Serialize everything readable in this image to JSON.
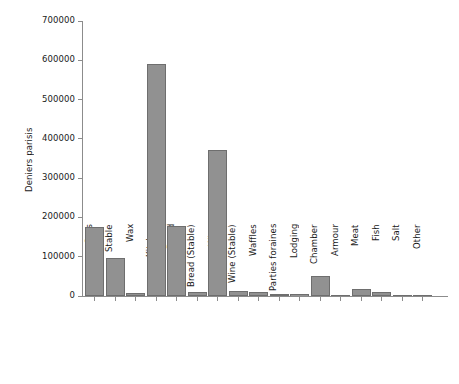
{
  "chart_data": {
    "type": "bar",
    "title": "",
    "subtitle": "",
    "xlabel": "",
    "ylabel": "Deniers parisis",
    "ylim": [
      0,
      700000
    ],
    "ytick_labels": [
      "0",
      "100000",
      "200000",
      "300000",
      "400000",
      "500000",
      "600000",
      "700000"
    ],
    "ytick_values": [
      0,
      100000,
      200000,
      300000,
      400000,
      500000,
      600000,
      700000
    ],
    "grid": false,
    "legend": null,
    "legend_position": "none",
    "bar_color": "#919191",
    "bar_edge_color": "#6e6e6e",
    "axis_color": "#8c8c8c",
    "categories": [
      "Oats",
      "Stable",
      "Wax",
      "Kitchen",
      "Bread",
      "Bread (Stable)",
      "Wine",
      "Wine (Stable)",
      "Waffles",
      "Parties foraines",
      "Lodging",
      "Chamber",
      "Armour",
      "Meat",
      "Fish",
      "Salt",
      "Other"
    ],
    "values": [
      175000,
      98000,
      7000,
      590000,
      178000,
      9000,
      372000,
      13000,
      9000,
      6000,
      5000,
      52000,
      3000,
      17000,
      11000,
      1000,
      500
    ]
  }
}
